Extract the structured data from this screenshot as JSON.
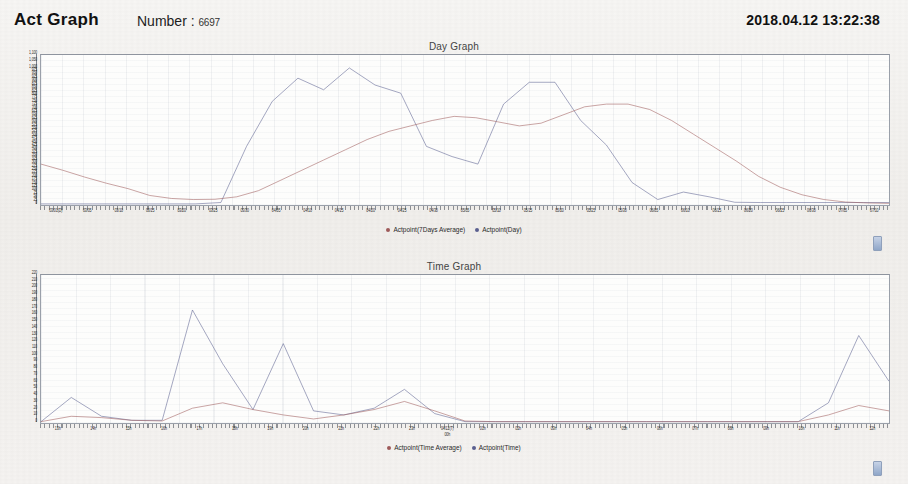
{
  "header": {
    "app_title": "Act Graph",
    "number_label": "Number :",
    "number_value": "6697",
    "timestamp": "2018.04.12 13:22:38"
  },
  "colors": {
    "series_blue": "#5a5f8f",
    "series_red": "#9e5a5a",
    "panel_border": "#9aa0aa",
    "plot_background": "#fdfdfc",
    "page_background": "#f4f3f1",
    "scroll_handle": "#8fa6c8"
  },
  "day_panel": {
    "title": "Day Graph",
    "legend": [
      {
        "label": "Actpoint(7Days Average)",
        "color": "#9e5a5a"
      },
      {
        "label": "Actpoint(Day)",
        "color": "#5a5f8f"
      }
    ],
    "scroll_handle_name": "day-graph-scrollbar-handle"
  },
  "time_panel": {
    "title": "Time Graph",
    "legend": [
      {
        "label": "Actpoint(Time Average)",
        "color": "#9e5a5a"
      },
      {
        "label": "Actpoint(Time)",
        "color": "#5a5f8f"
      }
    ],
    "scroll_handle_name": "time-graph-scrollbar-handle"
  },
  "chart_data": [
    {
      "type": "line",
      "title": "Day Graph",
      "xlabel": "",
      "ylabel": "",
      "grid": true,
      "legend_position": "bottom",
      "ylim": [
        0,
        1100
      ],
      "yticks": [
        0,
        25,
        50,
        75,
        100,
        125,
        150,
        175,
        200,
        225,
        250,
        275,
        300,
        325,
        350,
        375,
        400,
        425,
        450,
        475,
        500,
        525,
        550,
        575,
        600,
        625,
        650,
        675,
        700,
        725,
        750,
        775,
        800,
        825,
        850,
        875,
        900,
        925,
        950,
        975,
        1000,
        1050,
        1100
      ],
      "ytick_labels": [
        "0",
        "25",
        "50",
        "75",
        "100",
        "125",
        "150",
        "175",
        "200",
        "225",
        "250",
        "275",
        "300",
        "325",
        "350",
        "375",
        "400",
        "425",
        "450",
        "475",
        "500",
        "525",
        "550",
        "575",
        "600",
        "625",
        "650",
        "675",
        "700",
        "725",
        "750",
        "775",
        "800",
        "825",
        "850",
        "875",
        "900",
        "925",
        "950",
        "975",
        "1,000",
        "1,050",
        "1,100"
      ],
      "categories": [
        "03/01(D)",
        "03/05",
        "03/10",
        "03/15",
        "03/20",
        "03/25",
        "03/30",
        "04/05",
        "04/10",
        "04/15",
        "04/20",
        "04/25",
        "04/30",
        "05/05",
        "05/10",
        "05/15",
        "05/20",
        "05/25",
        "05/30",
        "06/05",
        "06/10",
        "06/15",
        "06/20",
        "06/25",
        "06/30",
        "07/05",
        "07/10"
      ],
      "xtick_labels": [
        "03/01(D)",
        "03/05",
        "03/10",
        "03/15",
        "03/20",
        "03/25",
        "03/30",
        "04/05",
        "04/10",
        "04/15",
        "04/20",
        "04/25",
        "04/30",
        "05/05",
        "05/10",
        "05/15",
        "05/20",
        "05/25",
        "05/30",
        "06/05",
        "06/10",
        "06/15",
        "06/20",
        "06/25",
        "06/30",
        "07/05",
        "07/10"
      ],
      "series": [
        {
          "name": "Actpoint(Day)",
          "color": "#5a5f8f",
          "values": [
            8,
            8,
            8,
            8,
            8,
            8,
            8,
            18,
            430,
            760,
            930,
            845,
            1005,
            880,
            820,
            430,
            355,
            300,
            740,
            900,
            900,
            620,
            440,
            165,
            40,
            95,
            60,
            20,
            18,
            18,
            18,
            18,
            18,
            18
          ]
        },
        {
          "name": "Actpoint(7Days Average)",
          "color": "#9e5a5a",
          "values": [
            300,
            255,
            205,
            160,
            120,
            70,
            48,
            40,
            42,
            60,
            105,
            180,
            255,
            330,
            405,
            480,
            540,
            580,
            620,
            650,
            640,
            610,
            580,
            600,
            660,
            720,
            740,
            740,
            700,
            620,
            520,
            420,
            320,
            210,
            130,
            75,
            40,
            22,
            15,
            12
          ]
        }
      ]
    },
    {
      "type": "line",
      "title": "Time Graph",
      "xlabel": "",
      "ylabel": "",
      "grid": true,
      "legend_position": "bottom",
      "ylim": [
        0,
        220
      ],
      "yticks": [
        0,
        10,
        20,
        30,
        40,
        50,
        60,
        70,
        80,
        90,
        100,
        110,
        120,
        130,
        140,
        150,
        160,
        170,
        180,
        190,
        200,
        210,
        220
      ],
      "ytick_labels": [
        "0",
        "10",
        "20",
        "30",
        "40",
        "50",
        "60",
        "70",
        "80",
        "90",
        "100",
        "110",
        "120",
        "130",
        "140",
        "150",
        "160",
        "170",
        "180",
        "190",
        "200",
        "210",
        "220"
      ],
      "categories": [
        "13h",
        "14h",
        "15h",
        "16h",
        "17h",
        "18h",
        "19h",
        "20h",
        "21h",
        "22h",
        "23h",
        "04/12(T) 00h",
        "01h",
        "02h",
        "03h",
        "04h",
        "05h",
        "06h",
        "07h",
        "08h",
        "09h",
        "10h",
        "11h",
        "12h"
      ],
      "xtick_labels": [
        "13h",
        "14h",
        "15h",
        "16h",
        "17h",
        "18h",
        "19h",
        "20h",
        "21h",
        "22h",
        "23h",
        "04/12(T) 00h",
        "01h",
        "02h",
        "03h",
        "04h",
        "05h",
        "06h",
        "07h",
        "08h",
        "09h",
        "10h",
        "11h",
        "12h"
      ],
      "series": [
        {
          "name": "Actpoint(Time)",
          "color": "#5a5f8f",
          "values": [
            2,
            38,
            10,
            4,
            4,
            168,
            88,
            20,
            118,
            18,
            12,
            22,
            50,
            14,
            2,
            2,
            2,
            2,
            2,
            2,
            2,
            2,
            2,
            2,
            2,
            2,
            30,
            130,
            62
          ]
        },
        {
          "name": "Actpoint(Time Average)",
          "color": "#9e5a5a",
          "values": [
            2,
            10,
            8,
            4,
            3,
            22,
            30,
            20,
            12,
            6,
            12,
            20,
            32,
            18,
            3,
            2,
            2,
            2,
            2,
            2,
            2,
            2,
            2,
            2,
            2,
            2,
            12,
            26,
            18
          ]
        }
      ]
    }
  ]
}
